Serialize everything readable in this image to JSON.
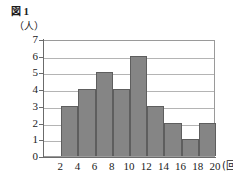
{
  "figure": {
    "caption_word": "図",
    "caption_number": "1",
    "y_axis_unit": "（人）",
    "x_axis_unit": "(回)"
  },
  "colors": {
    "bar_fill": "#858585",
    "bar_stroke": "#5e5e5e",
    "gridline": "#b4b4b4",
    "axis": "#6b6b6b",
    "plot_background": "#ffffff",
    "page_background": "#ffffff",
    "text": "#1a1a1a"
  },
  "chart_data": {
    "type": "bar",
    "title": "図1",
    "subtitle": "",
    "xlabel": "(回)",
    "ylabel": "（人）",
    "categories": [
      "2-4",
      "4-6",
      "6-8",
      "8-10",
      "10-12",
      "12-14",
      "14-16",
      "16-18",
      "18-20"
    ],
    "bin_edges": [
      2,
      4,
      6,
      8,
      10,
      12,
      14,
      16,
      18,
      20
    ],
    "values": [
      3,
      4,
      5,
      4,
      6,
      3,
      2,
      1,
      2
    ],
    "total": 30,
    "xlim": [
      0,
      20
    ],
    "ylim": [
      0,
      7
    ],
    "x_ticks": [
      "2",
      "4",
      "6",
      "8",
      "10",
      "12",
      "14",
      "16",
      "18",
      "20"
    ],
    "x_tick_values": [
      2,
      4,
      6,
      8,
      10,
      12,
      14,
      16,
      18,
      20
    ],
    "y_ticks": [
      "0",
      "1",
      "2",
      "3",
      "4",
      "5",
      "6",
      "7"
    ],
    "y_tick_values": [
      0,
      1,
      2,
      3,
      4,
      5,
      6,
      7
    ],
    "grid": true,
    "grid_axis": "y",
    "legend": false,
    "legend_position": "none",
    "bar_gap": 0
  }
}
